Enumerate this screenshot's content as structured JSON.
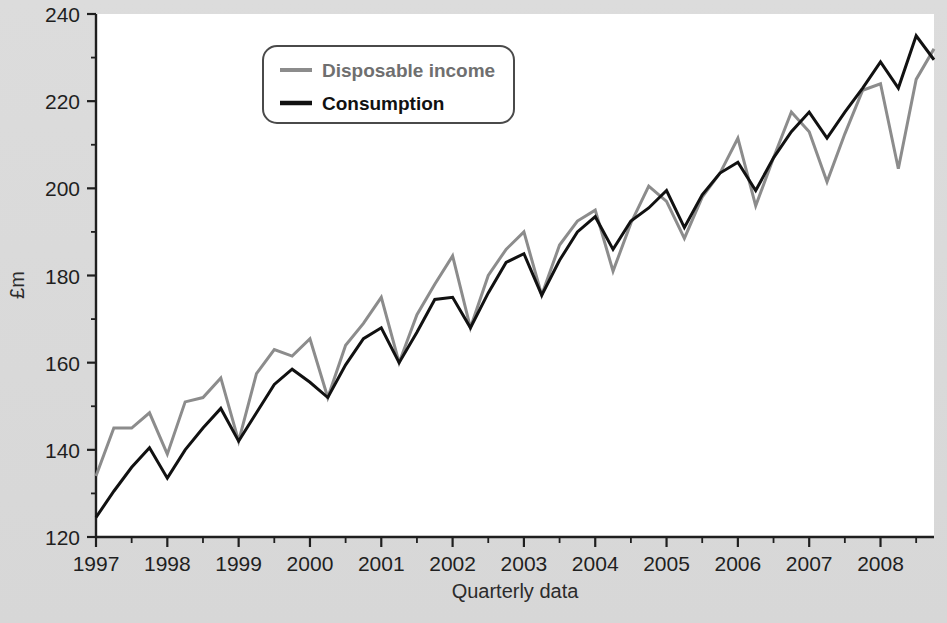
{
  "figure": {
    "background_color": "#d9d9d9",
    "plot_background_color": "#ffffff",
    "axis_color": "#1f1f1f"
  },
  "legend": {
    "position": "top-center-left",
    "border_color": "#4a4a4a",
    "background_color": "#ffffff",
    "entries": [
      {
        "label": "Disposable income",
        "color": "#8c8c8c",
        "text_color": "#6f6f6f"
      },
      {
        "label": "Consumption",
        "color": "#111111",
        "text_color": "#111111"
      }
    ]
  },
  "axes": {
    "y_label": "£m",
    "x_label": "Quarterly data",
    "y_ticks": [
      120,
      140,
      160,
      180,
      200,
      220,
      240
    ],
    "y_minor_ticks": [
      130,
      150,
      170,
      190,
      210,
      230
    ],
    "y_range": [
      120,
      240
    ],
    "x_ticks": [
      "1997",
      "1998",
      "1999",
      "2000",
      "2001",
      "2002",
      "2003",
      "2004",
      "2005",
      "2006",
      "2007",
      "2008"
    ],
    "x_range": [
      1997.0,
      2008.75
    ],
    "x_tick_interval_years": 1,
    "x_minor_tick_interval_years": 0.5
  },
  "chart_data": {
    "type": "line",
    "title": "",
    "subtitle": "",
    "xlabel": "Quarterly data",
    "ylabel": "£m",
    "ylim": [
      120,
      240
    ],
    "xlim": [
      1997.0,
      2008.75
    ],
    "grid": false,
    "legend_position": "upper-left-center",
    "x": [
      "1997 Q1",
      "1997 Q2",
      "1997 Q3",
      "1997 Q4",
      "1998 Q1",
      "1998 Q2",
      "1998 Q3",
      "1998 Q4",
      "1999 Q1",
      "1999 Q2",
      "1999 Q3",
      "1999 Q4",
      "2000 Q1",
      "2000 Q2",
      "2000 Q3",
      "2000 Q4",
      "2001 Q1",
      "2001 Q2",
      "2001 Q3",
      "2001 Q4",
      "2002 Q1",
      "2002 Q2",
      "2002 Q3",
      "2002 Q4",
      "2003 Q1",
      "2003 Q2",
      "2003 Q3",
      "2003 Q4",
      "2004 Q1",
      "2004 Q2",
      "2004 Q3",
      "2004 Q4",
      "2005 Q1",
      "2005 Q2",
      "2005 Q3",
      "2005 Q4",
      "2006 Q1",
      "2006 Q2",
      "2006 Q3",
      "2006 Q4",
      "2007 Q1",
      "2007 Q2",
      "2007 Q3",
      "2007 Q4",
      "2008 Q1",
      "2008 Q2",
      "2008 Q3",
      "2008 Q4"
    ],
    "x_numeric": [
      1997.0,
      1997.25,
      1997.5,
      1997.75,
      1998.0,
      1998.25,
      1998.5,
      1998.75,
      1999.0,
      1999.25,
      1999.5,
      1999.75,
      2000.0,
      2000.25,
      2000.5,
      2000.75,
      2001.0,
      2001.25,
      2001.5,
      2001.75,
      2002.0,
      2002.25,
      2002.5,
      2002.75,
      2003.0,
      2003.25,
      2003.5,
      2003.75,
      2004.0,
      2004.25,
      2004.5,
      2004.75,
      2005.0,
      2005.25,
      2005.5,
      2005.75,
      2006.0,
      2006.25,
      2006.5,
      2006.75,
      2007.0,
      2007.25,
      2007.5,
      2007.75,
      2008.0,
      2008.25,
      2008.5,
      2008.75
    ],
    "series": [
      {
        "name": "Disposable income",
        "color": "#8c8c8c",
        "width": 3,
        "values": [
          134.0,
          145.0,
          145.0,
          148.5,
          139.0,
          151.0,
          152.0,
          156.5,
          142.0,
          157.5,
          163.0,
          161.5,
          165.5,
          152.0,
          164.0,
          169.0,
          175.0,
          160.0,
          171.0,
          178.0,
          184.5,
          168.0,
          180.0,
          186.0,
          190.0,
          175.5,
          187.0,
          192.5,
          195.0,
          181.0,
          192.0,
          200.5,
          197.0,
          188.5,
          198.0,
          203.5,
          211.5,
          196.0,
          207.0,
          217.5,
          213.0,
          201.5,
          212.5,
          222.5,
          224.0,
          204.5,
          225.0,
          232.0
        ]
      },
      {
        "name": "Consumption",
        "color": "#111111",
        "width": 3,
        "values": [
          124.5,
          130.5,
          136.0,
          140.5,
          133.5,
          140.0,
          145.0,
          149.5,
          142.0,
          148.5,
          155.0,
          158.5,
          155.5,
          152.0,
          159.5,
          165.5,
          168.0,
          160.0,
          167.0,
          174.5,
          175.0,
          168.0,
          176.0,
          183.0,
          185.0,
          175.5,
          183.5,
          190.0,
          193.5,
          186.0,
          192.5,
          195.5,
          199.5,
          191.0,
          198.5,
          203.5,
          206.0,
          199.5,
          207.0,
          213.0,
          217.5,
          211.5,
          217.5,
          223.0,
          229.0,
          223.0,
          235.0,
          229.5
        ]
      }
    ]
  }
}
